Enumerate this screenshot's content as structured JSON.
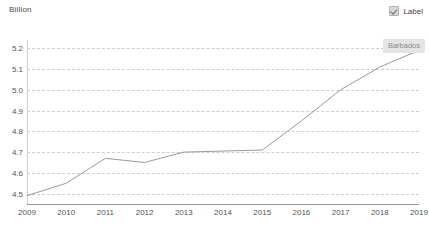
{
  "chart_data": {
    "type": "line",
    "title": "",
    "subtitle": "",
    "xlabel": "",
    "ylabel": "Billion",
    "ylim": [
      4.45,
      5.24
    ],
    "yticks": [
      "5.2",
      "5.1",
      "5.0",
      "4.9",
      "4.8",
      "4.7",
      "4.6",
      "4.5"
    ],
    "ytick_values": [
      5.2,
      5.1,
      5.0,
      4.9,
      4.8,
      4.7,
      4.6,
      4.5
    ],
    "grid": true,
    "grid_style": "dashed-horizontal",
    "legend_position": "top-right",
    "categories": [
      "2009",
      "2010",
      "2011",
      "2012",
      "2013",
      "2014",
      "2015",
      "2016",
      "2017",
      "2018",
      "2019"
    ],
    "x": [
      2009,
      2010,
      2011,
      2012,
      2013,
      2014,
      2015,
      2016,
      2017,
      2018,
      2019
    ],
    "series": [
      {
        "name": "Barbados",
        "values": [
          4.49,
          4.55,
          4.67,
          4.65,
          4.7,
          4.705,
          4.71,
          4.85,
          5.0,
          5.11,
          5.19
        ],
        "color": "#9a9a9a"
      }
    ],
    "annotations": [
      {
        "text": "Barbados",
        "near_point": "2019"
      }
    ]
  },
  "legend": {
    "checkbox_checked": true,
    "label": "Label"
  },
  "tooltip": {
    "text": "Barbados"
  },
  "colors": {
    "line": "#9a9a9a",
    "grid": "#cfcfcf",
    "axis": "#9a9a9a",
    "tick_text": "#555555",
    "tooltip_bg": "#e4e4e4",
    "tooltip_text": "#8b8b8b"
  }
}
